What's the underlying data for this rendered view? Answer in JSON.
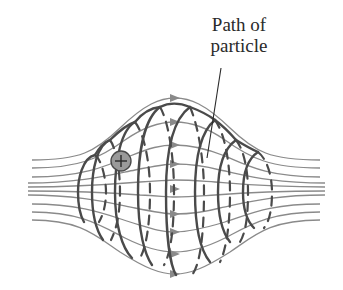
{
  "figure": {
    "label_line1": "Path of",
    "label_line2": "particle",
    "particle_symbol": "+",
    "colors": {
      "field_line": "#8a8a8a",
      "path": "#4a4a4a",
      "particle_fill": "#9a9a9a",
      "text": "#2a2a2a",
      "background": "#ffffff"
    }
  }
}
